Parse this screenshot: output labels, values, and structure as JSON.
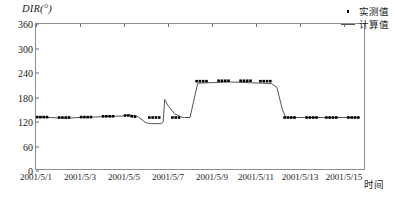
{
  "chart_data": {
    "type": "line",
    "title": "",
    "ylabel": "DIR(°)",
    "xlabel": "时间",
    "ylim": [
      0,
      360
    ],
    "yticks": [
      0,
      60,
      120,
      180,
      240,
      300,
      360
    ],
    "xticks": [
      "2001/5/1",
      "2001/5/3",
      "2001/5/5",
      "2001/5/7",
      "2001/5/9",
      "2001/5/11",
      "2001/5/13",
      "2001/5/15"
    ],
    "xlim": [
      "2001/5/1",
      "2001/5/16"
    ],
    "grid": false,
    "legend_position": "top-right",
    "series": [
      {
        "name": "实测值",
        "marker": "square-dot",
        "color": "#000000",
        "points": [
          {
            "x": 1.05,
            "y": 132
          },
          {
            "x": 1.2,
            "y": 132
          },
          {
            "x": 1.35,
            "y": 132
          },
          {
            "x": 1.5,
            "y": 132
          },
          {
            "x": 2.05,
            "y": 131
          },
          {
            "x": 2.2,
            "y": 131
          },
          {
            "x": 2.35,
            "y": 131
          },
          {
            "x": 2.5,
            "y": 131
          },
          {
            "x": 3.05,
            "y": 132
          },
          {
            "x": 3.2,
            "y": 132
          },
          {
            "x": 3.35,
            "y": 132
          },
          {
            "x": 3.5,
            "y": 132
          },
          {
            "x": 4.05,
            "y": 134
          },
          {
            "x": 4.2,
            "y": 134
          },
          {
            "x": 4.35,
            "y": 134
          },
          {
            "x": 4.5,
            "y": 134
          },
          {
            "x": 5.05,
            "y": 136
          },
          {
            "x": 5.2,
            "y": 136
          },
          {
            "x": 5.35,
            "y": 134
          },
          {
            "x": 5.5,
            "y": 133
          },
          {
            "x": 6.15,
            "y": 131
          },
          {
            "x": 6.3,
            "y": 131
          },
          {
            "x": 6.45,
            "y": 131
          },
          {
            "x": 6.6,
            "y": 131
          },
          {
            "x": 7.2,
            "y": 131
          },
          {
            "x": 7.35,
            "y": 131
          },
          {
            "x": 7.5,
            "y": 131
          },
          {
            "x": 8.3,
            "y": 220
          },
          {
            "x": 8.45,
            "y": 220
          },
          {
            "x": 8.6,
            "y": 220
          },
          {
            "x": 8.75,
            "y": 220
          },
          {
            "x": 9.3,
            "y": 221
          },
          {
            "x": 9.45,
            "y": 221
          },
          {
            "x": 9.6,
            "y": 221
          },
          {
            "x": 9.75,
            "y": 221
          },
          {
            "x": 10.3,
            "y": 221
          },
          {
            "x": 10.45,
            "y": 221
          },
          {
            "x": 10.6,
            "y": 221
          },
          {
            "x": 10.75,
            "y": 221
          },
          {
            "x": 11.2,
            "y": 220
          },
          {
            "x": 11.35,
            "y": 220
          },
          {
            "x": 11.5,
            "y": 220
          },
          {
            "x": 11.65,
            "y": 220
          },
          {
            "x": 12.3,
            "y": 131
          },
          {
            "x": 12.45,
            "y": 131
          },
          {
            "x": 12.6,
            "y": 131
          },
          {
            "x": 12.75,
            "y": 131
          },
          {
            "x": 13.3,
            "y": 131
          },
          {
            "x": 13.45,
            "y": 131
          },
          {
            "x": 13.6,
            "y": 131
          },
          {
            "x": 13.75,
            "y": 131
          },
          {
            "x": 14.2,
            "y": 131
          },
          {
            "x": 14.35,
            "y": 131
          },
          {
            "x": 14.5,
            "y": 131
          },
          {
            "x": 14.65,
            "y": 131
          },
          {
            "x": 15.2,
            "y": 131
          },
          {
            "x": 15.35,
            "y": 131
          },
          {
            "x": 15.5,
            "y": 131
          },
          {
            "x": 15.65,
            "y": 131
          }
        ]
      },
      {
        "name": "计算值",
        "marker": "none",
        "color": "#555555",
        "points": [
          {
            "x": 1.05,
            "y": 132
          },
          {
            "x": 1.6,
            "y": 131
          },
          {
            "x": 2.0,
            "y": 130
          },
          {
            "x": 2.6,
            "y": 130
          },
          {
            "x": 3.0,
            "y": 131
          },
          {
            "x": 3.6,
            "y": 132
          },
          {
            "x": 4.0,
            "y": 133
          },
          {
            "x": 4.6,
            "y": 134
          },
          {
            "x": 5.0,
            "y": 135
          },
          {
            "x": 5.3,
            "y": 137
          },
          {
            "x": 5.6,
            "y": 134
          },
          {
            "x": 5.85,
            "y": 124
          },
          {
            "x": 6.0,
            "y": 118
          },
          {
            "x": 6.25,
            "y": 116
          },
          {
            "x": 6.7,
            "y": 116
          },
          {
            "x": 6.78,
            "y": 120
          },
          {
            "x": 6.85,
            "y": 175
          },
          {
            "x": 7.0,
            "y": 160
          },
          {
            "x": 7.3,
            "y": 140
          },
          {
            "x": 7.6,
            "y": 132
          },
          {
            "x": 7.75,
            "y": 131
          },
          {
            "x": 8.0,
            "y": 131
          },
          {
            "x": 8.35,
            "y": 215
          },
          {
            "x": 8.8,
            "y": 216
          },
          {
            "x": 9.3,
            "y": 217
          },
          {
            "x": 9.8,
            "y": 218
          },
          {
            "x": 10.3,
            "y": 217
          },
          {
            "x": 10.8,
            "y": 216
          },
          {
            "x": 11.3,
            "y": 215
          },
          {
            "x": 11.7,
            "y": 214
          },
          {
            "x": 11.95,
            "y": 205
          },
          {
            "x": 12.2,
            "y": 150
          },
          {
            "x": 12.35,
            "y": 132
          },
          {
            "x": 12.6,
            "y": 131
          },
          {
            "x": 13.2,
            "y": 131
          },
          {
            "x": 13.8,
            "y": 131
          },
          {
            "x": 14.4,
            "y": 131
          },
          {
            "x": 15.0,
            "y": 131
          },
          {
            "x": 15.7,
            "y": 131
          }
        ]
      }
    ],
    "legend": [
      {
        "label": "实测值",
        "marker": "dot"
      },
      {
        "label": "计算值",
        "marker": "line"
      }
    ]
  }
}
